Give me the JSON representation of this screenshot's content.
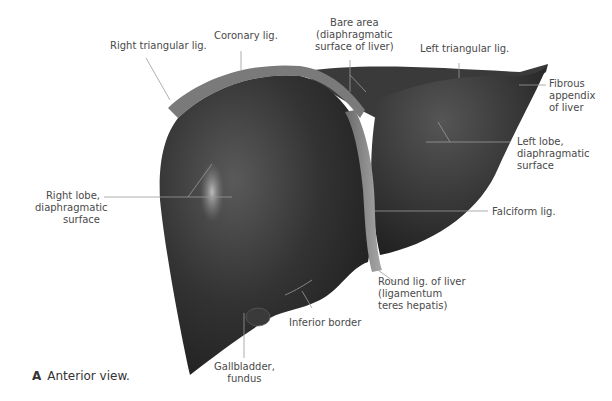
{
  "figure": {
    "caption_letter": "A",
    "caption_text": "Anterior view.",
    "labels": {
      "right_triangular": "Right triangular lig.",
      "coronary": "Coronary lig.",
      "bare_area": [
        "Bare area",
        "(diaphragmatic",
        "surface of liver)"
      ],
      "left_triangular": "Left triangular lig.",
      "fibrous_appendix": [
        "Fibrous",
        "appendix",
        "of liver"
      ],
      "left_lobe": [
        "Left lobe,",
        "diaphragmatic",
        "surface"
      ],
      "right_lobe": [
        "Right lobe,",
        "diaphragmatic",
        "surface"
      ],
      "falciform": "Falciform lig.",
      "round_lig": [
        "Round lig. of liver",
        "(ligamentum",
        "teres hepatis)"
      ],
      "inferior_border": "Inferior border",
      "gallbladder": [
        "Gallbladder,",
        "fundus"
      ]
    },
    "colors": {
      "liver_dark": "#2a2a2a",
      "liver_mid": "#444444",
      "ligament": "#8a8a8a",
      "leader_line": "#9a9a9a",
      "text": "#4a4a4a"
    }
  }
}
